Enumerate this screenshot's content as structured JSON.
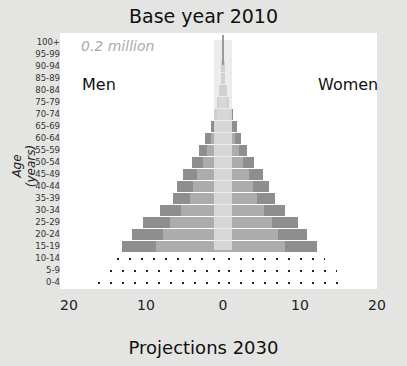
{
  "header": {
    "title": "Base year 2010"
  },
  "footer": {
    "title": "Projections 2030"
  },
  "labels": {
    "unit": "0.2 million",
    "men": "Men",
    "women": "Women",
    "ylabel": "Age (years)"
  },
  "colors": {
    "background": "#e4e4e2",
    "panel": "#ffffff",
    "outer_bar": "#8e8e8e",
    "inner_bar": "#acacac",
    "center_band": "#e6e6e6",
    "dots": "#222222"
  },
  "chart_data": {
    "type": "bar",
    "orientation": "horizontal",
    "subtype": "population-pyramid",
    "title": "Base year 2010",
    "subtitle": "Projections 2030",
    "xlabel": "",
    "ylabel": "Age (years)",
    "unit_annotation": "0.2 million",
    "xlim": [
      -20,
      20
    ],
    "x_ticks": [
      "20",
      "10",
      "0",
      "10",
      "20"
    ],
    "categories": [
      "100+",
      "95-99",
      "90-94",
      "85-89",
      "80-84",
      "75-79",
      "70-74",
      "65-69",
      "60-64",
      "55-59",
      "50-54",
      "45-49",
      "40-44",
      "35-39",
      "30-34",
      "25-29",
      "20-24",
      "15-19",
      "10-14",
      "5-9",
      "0-4"
    ],
    "series": [
      {
        "name": "Men",
        "side": "left",
        "values": [
          0.1,
          0.1,
          0.2,
          0.3,
          0.5,
          0.8,
          1.2,
          1.6,
          2.3,
          3.1,
          4.0,
          5.2,
          6.0,
          6.5,
          8.2,
          10.4,
          11.8,
          13.1,
          14.4,
          15.3,
          16.9
        ]
      },
      {
        "name": "Women",
        "side": "right",
        "values": [
          0.1,
          0.1,
          0.2,
          0.3,
          0.5,
          0.8,
          1.3,
          1.8,
          2.3,
          3.1,
          4.0,
          5.2,
          6.0,
          6.7,
          8.1,
          9.7,
          10.9,
          12.2,
          13.2,
          14.8,
          15.6
        ]
      }
    ],
    "projected_only_categories": [
      "10-14",
      "5-9",
      "0-4"
    ],
    "legend": [
      "Men",
      "Women"
    ],
    "grid": false
  }
}
